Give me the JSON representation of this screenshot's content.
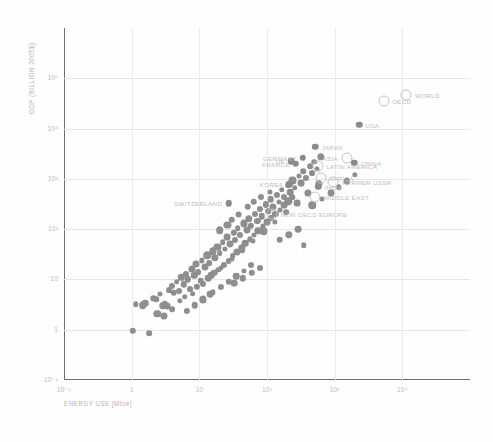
{
  "chart_data": {
    "type": "scatter",
    "title": "",
    "xlabel": "ENERGY USE [Mtoe]",
    "ylabel": "GDP (BILLION 2005$)",
    "xscale": "log",
    "yscale": "log",
    "xlim": [
      0.1,
      100000
    ],
    "ylim": [
      0.1,
      1000000
    ],
    "grid": true,
    "legend": "none",
    "xticks": [
      "10⁻¹",
      "1",
      "10",
      "10²",
      "10³",
      "10⁴"
    ],
    "xtick_values": [
      0.1,
      1,
      10,
      100,
      1000,
      10000
    ],
    "yticks": [
      "10⁵",
      "10⁴",
      "10³",
      "10²",
      "10",
      "1",
      "10⁻¹"
    ],
    "ytick_values": [
      100000,
      10000,
      1000,
      100,
      10,
      1,
      0.1
    ],
    "series": [
      {
        "name": "countries",
        "marker": "filled-circle",
        "color": "#8e8e8e",
        "points": [
          [
            1.05,
            0.95
          ],
          [
            1.8,
            0.85
          ],
          [
            1.15,
            3.2
          ],
          [
            1.45,
            3.1
          ],
          [
            1.6,
            3.4
          ],
          [
            2.1,
            4.2
          ],
          [
            2.3,
            4.0
          ],
          [
            2.6,
            5.1
          ],
          [
            2.9,
            3.0
          ],
          [
            3.1,
            3.3
          ],
          [
            3.3,
            2.9
          ],
          [
            3.6,
            6.2
          ],
          [
            3.9,
            7.5
          ],
          [
            4.2,
            5.4
          ],
          [
            4.6,
            9.0
          ],
          [
            5.0,
            6.0
          ],
          [
            5.4,
            11.0
          ],
          [
            5.9,
            8.0
          ],
          [
            6.3,
            13.0
          ],
          [
            6.8,
            10.0
          ],
          [
            7.2,
            6.5
          ],
          [
            7.8,
            16.0
          ],
          [
            8.4,
            12.0
          ],
          [
            9.0,
            20.0
          ],
          [
            9.6,
            14.0
          ],
          [
            10.5,
            9.5
          ],
          [
            11.0,
            24.0
          ],
          [
            12.0,
            18.0
          ],
          [
            13.0,
            30.0
          ],
          [
            14.0,
            21.0
          ],
          [
            15.0,
            12.0
          ],
          [
            16.0,
            36.0
          ],
          [
            17.0,
            27.0
          ],
          [
            18.5,
            45.0
          ],
          [
            20.0,
            33.0
          ],
          [
            21.0,
            17.0
          ],
          [
            22.0,
            55.0
          ],
          [
            24.0,
            40.0
          ],
          [
            26.0,
            70.0
          ],
          [
            28.0,
            50.0
          ],
          [
            30.0,
            26.0
          ],
          [
            32.0,
            85.0
          ],
          [
            34.0,
            62.0
          ],
          [
            37.0,
            105.0
          ],
          [
            40.0,
            75.0
          ],
          [
            43.0,
            38.0
          ],
          [
            46.0,
            130.0
          ],
          [
            50.0,
            95.0
          ],
          [
            54.0,
            160.0
          ],
          [
            58.0,
            115.0
          ],
          [
            62.0,
            58.0
          ],
          [
            67.0,
            200.0
          ],
          [
            72.0,
            145.0
          ],
          [
            78.0,
            250.0
          ],
          [
            84.0,
            180.0
          ],
          [
            90.0,
            90.0
          ],
          [
            97.0,
            310.0
          ],
          [
            105.0,
            225.0
          ],
          [
            113.0,
            390.0
          ],
          [
            122.0,
            280.0
          ],
          [
            131.0,
            140.0
          ],
          [
            141.0,
            480.0
          ],
          [
            152.0,
            350.0
          ],
          [
            164.0,
            600.0
          ],
          [
            177.0,
            430.0
          ],
          [
            190.0,
            215.0
          ],
          [
            205.0,
            750.0
          ],
          [
            221.0,
            540.0
          ],
          [
            238.0,
            930.0
          ],
          [
            257.0,
            670.0
          ],
          [
            277.0,
            335.0
          ],
          [
            298.0,
            1150.0
          ],
          [
            321.0,
            830.0
          ],
          [
            346.0,
            1430.0
          ],
          [
            373.0,
            1030.0
          ],
          [
            402.0,
            515.0
          ],
          [
            433.0,
            1780.0
          ],
          [
            467.0,
            1280.0
          ],
          [
            503.0,
            2200.0
          ],
          [
            542.0,
            1590.0
          ],
          [
            584.0,
            800.0
          ],
          [
            630.0,
            2720.0
          ],
          [
            2.4,
            2.1
          ],
          [
            3.0,
            1.85
          ],
          [
            4.0,
            2.6
          ],
          [
            5.2,
            3.7
          ],
          [
            6.1,
            4.5
          ],
          [
            8.0,
            5.2
          ],
          [
            9.2,
            7.1
          ],
          [
            11.5,
            8.2
          ],
          [
            13.5,
            10.5
          ],
          [
            16.5,
            13.5
          ],
          [
            19.0,
            15.5
          ],
          [
            23.0,
            19.5
          ],
          [
            27.0,
            23.5
          ],
          [
            31.0,
            29.0
          ],
          [
            36.0,
            35.0
          ],
          [
            42.0,
            43.0
          ],
          [
            48.0,
            52.0
          ],
          [
            56.0,
            63.0
          ],
          [
            64.0,
            77.0
          ],
          [
            74.0,
            93.0
          ],
          [
            86.0,
            113.0
          ],
          [
            99.0,
            137.0
          ],
          [
            115.0,
            166.0
          ],
          [
            133.0,
            201.0
          ],
          [
            154.0,
            244.0
          ],
          [
            178.0,
            296.0
          ],
          [
            206.0,
            359.0
          ],
          [
            238.0,
            435.0
          ],
          [
            16.0,
            5.5
          ],
          [
            21.0,
            7.0
          ],
          [
            27.0,
            9.0
          ],
          [
            35.0,
            11.5
          ],
          [
            45.0,
            15.0
          ],
          [
            58.0,
            19.0
          ],
          [
            6.5,
            2.4
          ],
          [
            8.6,
            3.1
          ],
          [
            11.2,
            4.0
          ],
          [
            14.5,
            5.1
          ],
          [
            52.0,
            280.0
          ],
          [
            64.0,
            350.0
          ],
          [
            82.0,
            430.0
          ],
          [
            110.0,
            560.0
          ],
          [
            30.0,
            155.0
          ],
          [
            38.0,
            195.0
          ],
          [
            26.0,
            120.0
          ],
          [
            20.0,
            95.0
          ],
          [
            33.0,
            8.5
          ],
          [
            44.0,
            10.5
          ],
          [
            60.0,
            13.5
          ],
          [
            80.0,
            17.0
          ],
          [
            155.0,
            62.0
          ],
          [
            210.0,
            78.0
          ],
          [
            290.0,
            100.0
          ],
          [
            350.0,
            48.0
          ],
          [
            470.0,
            300.0
          ],
          [
            640.0,
            400.0
          ],
          [
            880.0,
            520.0
          ],
          [
            1150.0,
            680.0
          ],
          [
            1500.0,
            900.0
          ],
          [
            2000.0,
            1200.0
          ]
        ]
      },
      {
        "name": "aggregates-filled",
        "marker": "filled-circle",
        "color": "#8a8a8a",
        "labeled": [
          {
            "label": "USA",
            "x": 2300,
            "y": 12000,
            "side": "right"
          },
          {
            "label": "JAPAN",
            "x": 520,
            "y": 4400,
            "side": "right"
          },
          {
            "label": "CHINA",
            "x": 1950,
            "y": 2100,
            "side": "right"
          },
          {
            "label": "GERMANY",
            "x": 340,
            "y": 2600,
            "side": "left"
          },
          {
            "label": "UK",
            "x": 228,
            "y": 2250,
            "side": "left"
          },
          {
            "label": "FRANCE",
            "x": 268,
            "y": 2000,
            "side": "left"
          },
          {
            "label": "KOREA",
            "x": 215,
            "y": 780,
            "side": "left"
          },
          {
            "label": "INDIA",
            "x": 570,
            "y": 700,
            "side": "right"
          },
          {
            "label": "SWITZERLAND",
            "x": 27,
            "y": 330,
            "side": "left"
          }
        ]
      },
      {
        "name": "aggregates-open",
        "marker": "open-circle",
        "color": "#c3c3c3",
        "labeled": [
          {
            "label": "WORLD",
            "x": 11500,
            "y": 47000,
            "side": "right"
          },
          {
            "label": "OECD",
            "x": 5300,
            "y": 36000,
            "side": "right"
          },
          {
            "label": "ASIA",
            "x": 1500,
            "y": 2600,
            "side": "left"
          },
          {
            "label": "LATIN AMERICA",
            "x": 560,
            "y": 1800,
            "side": "right"
          },
          {
            "label": "AFRICA",
            "x": 620,
            "y": 1050,
            "side": "right"
          },
          {
            "label": "FORMER USSR",
            "x": 960,
            "y": 870,
            "side": "right"
          },
          {
            "label": "MIDDLE EAST",
            "x": 520,
            "y": 430,
            "side": "right"
          },
          {
            "label": "NON OECD EUROPE",
            "x": 120,
            "y": 200,
            "side": "right"
          }
        ]
      }
    ]
  }
}
